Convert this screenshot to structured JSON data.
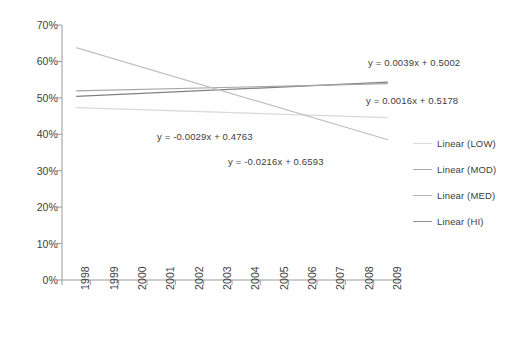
{
  "chart_data": {
    "type": "line",
    "title": "",
    "xlabel": "",
    "ylabel": "",
    "grid": false,
    "legend_position": "right",
    "x": [
      1998,
      1999,
      2000,
      2001,
      2002,
      2003,
      2004,
      2005,
      2006,
      2007,
      2008,
      2009
    ],
    "x_tick_labels": [
      "1998",
      "1999",
      "2000",
      "2001",
      "2002",
      "2003",
      "2004",
      "2005",
      "2006",
      "2007",
      "2008",
      "2009"
    ],
    "ylim": [
      0,
      70
    ],
    "y_tick_labels": [
      "0%",
      "10%",
      "20%",
      "30%",
      "40%",
      "50%",
      "60%",
      "70%"
    ],
    "y_ticks": [
      0,
      10,
      20,
      30,
      40,
      50,
      60,
      70
    ],
    "series": [
      {
        "name": "Linear (LOW)",
        "equation": "y = -0.0029x + 0.4763",
        "slope": -0.0029,
        "intercept": 0.4763,
        "color": "#d9d9d9",
        "start_value": 47.3,
        "end_value": 44.6
      },
      {
        "name": "Linear (MOD)",
        "equation": "y = 0.0039x + 0.5002",
        "slope": 0.0039,
        "intercept": 0.5002,
        "color": "#808080",
        "start_value": 50.4,
        "end_value": 54.3
      },
      {
        "name": "Linear (MED)",
        "equation": "y = 0.0016x + 0.5178",
        "slope": 0.0016,
        "intercept": 0.5178,
        "color": "#a6a6a6",
        "start_value": 51.9,
        "end_value": 53.9
      },
      {
        "name": "Linear (HI)",
        "equation": "y = -0.0216x + 0.6593",
        "slope": -0.0216,
        "intercept": 0.6593,
        "color": "#bfbfbf",
        "start_value": 63.8,
        "end_value": 38.5
      }
    ],
    "annotations": [
      {
        "text": "y = 0.0039x + 0.5002",
        "x": 368,
        "y": 57
      },
      {
        "text": "y = 0.0016x + 0.5178",
        "x": 366,
        "y": 95
      },
      {
        "text": "y = -0.0029x + 0.4763",
        "x": 157,
        "y": 131
      },
      {
        "text": "y = -0.0216x + 0.6593",
        "x": 228,
        "y": 156
      }
    ],
    "axis_color": "#9a9a9a"
  },
  "legend": {
    "items": [
      {
        "label": "Linear (LOW)",
        "color": "#d9d9d9"
      },
      {
        "label": "Linear (MOD)",
        "color": "#a8a8a8"
      },
      {
        "label": "Linear (MED)",
        "color": "#b5b5b5"
      },
      {
        "label": "Linear (HI)",
        "color": "#8f8f8f"
      }
    ]
  }
}
